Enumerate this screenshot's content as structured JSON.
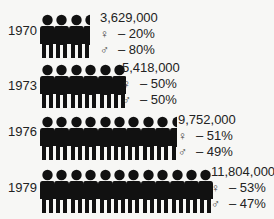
{
  "chart_data": {
    "type": "pictograph",
    "title": "",
    "unit": "1 figure ≈ 1,000,000 people",
    "categories": [
      "1970",
      "1973",
      "1976",
      "1979"
    ],
    "series": [
      {
        "name": "total",
        "values": [
          3629000,
          5418000,
          9752000,
          11804000
        ]
      },
      {
        "name": "female %",
        "values": [
          20,
          50,
          51,
          53
        ]
      },
      {
        "name": "male %",
        "values": [
          80,
          50,
          49,
          47
        ]
      }
    ],
    "figure_counts": [
      3.5,
      6,
      9.5,
      12
    ]
  },
  "rows": [
    {
      "year": "1970",
      "total": "3,629,000",
      "female": "– 20%",
      "male": "– 80%"
    },
    {
      "year": "1973",
      "total": "5,418,000",
      "female": "– 50%",
      "male": "– 50%"
    },
    {
      "year": "1976",
      "total": "9,752,000",
      "female": "– 51%",
      "male": "– 49%"
    },
    {
      "year": "1979",
      "total": "11,804,000",
      "female": "– 53%",
      "male": "– 47%"
    }
  ],
  "symbols": {
    "female": "♀",
    "male": "♂"
  },
  "colors": {
    "figure": "#111111",
    "background": "#f7f7f5",
    "text": "#222222"
  }
}
